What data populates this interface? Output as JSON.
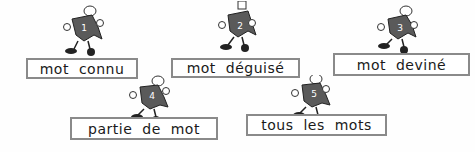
{
  "items": [
    {
      "number": "1",
      "label": "mot connu"
    },
    {
      "number": "2",
      "label": "mot déguisé"
    },
    {
      "number": "3",
      "label": "mot deviné"
    },
    {
      "number": "4",
      "label": "partie de mot"
    },
    {
      "number": "5",
      "label": "tous les mots"
    }
  ],
  "colors": {
    "border": "#8a8a8a",
    "mascot_body": "#5a5a5a",
    "text": "#1a1a1a"
  }
}
